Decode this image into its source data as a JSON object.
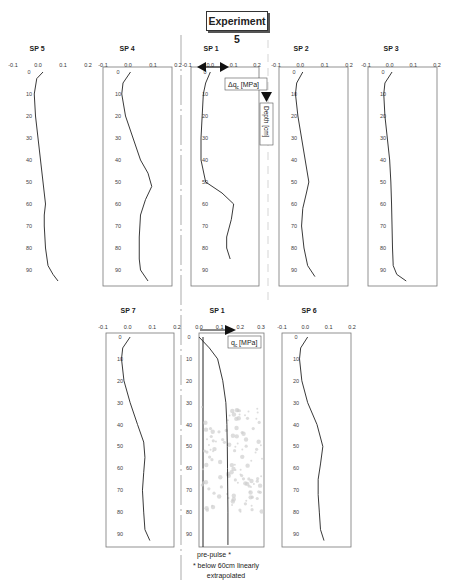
{
  "title": "Experiment 5",
  "chart_data": [
    {
      "type": "line",
      "panel": "SP 5",
      "title": "SP 5",
      "xlabel": "Δq_c [MPa]",
      "ylabel": "Depth [cm]",
      "xticks": [
        "-0.1",
        "0.0",
        "0.1",
        "0.2"
      ],
      "yticks": [
        "0",
        "10",
        "20",
        "30",
        "40",
        "50",
        "60",
        "70",
        "80",
        "90"
      ],
      "xlim": [
        -0.1,
        0.2
      ],
      "ylim": [
        0,
        95
      ],
      "box": false,
      "x": [
        0.02,
        -0.005,
        -0.015,
        -0.01,
        0.0,
        0.01,
        0.02,
        0.025,
        0.03,
        0.025,
        0.025,
        0.03,
        0.04,
        0.06,
        0.08
      ],
      "y": [
        0,
        3,
        10,
        20,
        30,
        40,
        50,
        55,
        60,
        65,
        70,
        80,
        88,
        92,
        95
      ]
    },
    {
      "type": "line",
      "panel": "SP 4",
      "title": "SP 4",
      "xticks": [
        "-0.1",
        "0.0",
        "0.1",
        "0.2"
      ],
      "yticks": [
        "0",
        "10",
        "20",
        "30",
        "40",
        "50",
        "60",
        "70",
        "80",
        "90"
      ],
      "xlim": [
        -0.1,
        0.2
      ],
      "ylim": [
        0,
        95
      ],
      "box": true,
      "x": [
        0.01,
        -0.02,
        -0.025,
        -0.01,
        0.02,
        0.05,
        0.08,
        0.095,
        0.07,
        0.05,
        0.045,
        0.045,
        0.05,
        0.08
      ],
      "y": [
        0,
        5,
        10,
        20,
        30,
        40,
        46,
        52,
        58,
        65,
        75,
        85,
        90,
        95
      ]
    },
    {
      "type": "line",
      "panel": "SP 1 (top)",
      "title": "SP 1",
      "xlabel": "Δq_c [MPa]",
      "ylabel": "Depth [cm]",
      "xticks": [
        "-0.1",
        "0.0",
        "0.1",
        "0.2"
      ],
      "yticks": [
        "0",
        "10",
        "20",
        "30",
        "40",
        "50",
        "60",
        "70",
        "80",
        "90"
      ],
      "xlim": [
        -0.1,
        0.2
      ],
      "ylim": [
        0,
        95
      ],
      "box": true,
      "x": [
        0.0,
        -0.02,
        -0.03,
        -0.035,
        -0.04,
        -0.04,
        -0.02,
        0.05,
        0.1,
        0.09,
        0.07,
        0.07,
        0.085
      ],
      "y": [
        0,
        5,
        10,
        20,
        30,
        40,
        50,
        55,
        60,
        67,
        75,
        80,
        85
      ]
    },
    {
      "type": "line",
      "panel": "SP 2",
      "title": "SP 2",
      "xticks": [
        "-0.1",
        "0.0",
        "0.1",
        "0.2"
      ],
      "yticks": [
        "0",
        "10",
        "20",
        "30",
        "40",
        "50",
        "60",
        "70",
        "80",
        "90"
      ],
      "xlim": [
        -0.1,
        0.2
      ],
      "ylim": [
        0,
        95
      ],
      "box": true,
      "x": [
        0.01,
        -0.015,
        -0.02,
        -0.01,
        0.005,
        0.02,
        0.035,
        0.025,
        0.01,
        0.005,
        0.015,
        0.03,
        0.06
      ],
      "y": [
        0,
        5,
        10,
        20,
        30,
        40,
        50,
        55,
        62,
        70,
        80,
        88,
        93
      ]
    },
    {
      "type": "line",
      "panel": "SP 3",
      "title": "SP 3",
      "xticks": [
        "-0.1",
        "0.0",
        "0.1",
        "0.2"
      ],
      "yticks": [
        "0",
        "10",
        "20",
        "30",
        "40",
        "50",
        "60",
        "70",
        "80",
        "90"
      ],
      "xlim": [
        -0.1,
        0.2
      ],
      "ylim": [
        0,
        95
      ],
      "box": true,
      "x": [
        0.01,
        -0.02,
        -0.025,
        -0.02,
        -0.01,
        0.0,
        0.005,
        0.008,
        0.01,
        0.012,
        0.015,
        0.03,
        0.07
      ],
      "y": [
        0,
        5,
        10,
        20,
        30,
        40,
        50,
        60,
        70,
        80,
        88,
        92,
        95
      ]
    },
    {
      "type": "line",
      "panel": "SP 7",
      "title": "SP 7",
      "xticks": [
        "-0.1",
        "0.0",
        "0.1",
        "0.2"
      ],
      "yticks": [
        "0",
        "10",
        "20",
        "30",
        "40",
        "50",
        "60",
        "70",
        "80",
        "90"
      ],
      "xlim": [
        -0.1,
        0.2
      ],
      "ylim": [
        0,
        95
      ],
      "box": true,
      "x": [
        0.01,
        -0.02,
        -0.025,
        -0.015,
        0.01,
        0.04,
        0.065,
        0.07,
        0.065,
        0.06,
        0.065,
        0.07,
        0.09
      ],
      "y": [
        0,
        5,
        10,
        20,
        30,
        40,
        48,
        55,
        62,
        70,
        80,
        88,
        93
      ]
    },
    {
      "type": "line",
      "panel": "SP 1 (bottom)",
      "title": "SP 1",
      "xlabel": "q_c [MPa]",
      "xticks": [
        "0.0",
        "0.1",
        "0.2",
        "0.3"
      ],
      "yticks": [
        "0",
        "10",
        "20",
        "30",
        "40",
        "50",
        "60",
        "70",
        "80",
        "90"
      ],
      "xlim": [
        0.0,
        0.3
      ],
      "ylim": [
        0,
        95
      ],
      "box": true,
      "annotation": [
        "pre-pulse *",
        "* below 60cm linearly extrapolated"
      ],
      "x": [
        0.0,
        0.05,
        0.09,
        0.115,
        0.13,
        0.135,
        0.137,
        0.138,
        0.14,
        0.14
      ],
      "y": [
        0,
        5,
        10,
        20,
        30,
        40,
        50,
        60,
        80,
        95
      ],
      "vertical_line_at_x0": true
    },
    {
      "type": "line",
      "panel": "SP 6",
      "title": "SP 6",
      "xticks": [
        "-0.1",
        "0.0",
        "0.1",
        "0.2"
      ],
      "yticks": [
        "0",
        "10",
        "20",
        "30",
        "40",
        "50",
        "60",
        "70",
        "80",
        "90"
      ],
      "xlim": [
        -0.1,
        0.2
      ],
      "ylim": [
        0,
        95
      ],
      "box": true,
      "x": [
        0.01,
        -0.02,
        -0.025,
        -0.015,
        0.01,
        0.05,
        0.075,
        0.065,
        0.055,
        0.055,
        0.06,
        0.065,
        0.08
      ],
      "y": [
        0,
        5,
        10,
        20,
        30,
        40,
        50,
        58,
        65,
        72,
        80,
        88,
        93
      ]
    }
  ],
  "annotations": {
    "dqc_label": "Δq",
    "dqc_sub": "c",
    "dqc_unit": " [MPa]",
    "depth_label": "Depth [cm]",
    "qc_label": "q",
    "qc_sub": "c",
    "qc_unit": " [MPa]",
    "prepulse": "pre-pulse *",
    "note_line1": "* below 60cm linearly",
    "note_line2": "extrapolated"
  }
}
